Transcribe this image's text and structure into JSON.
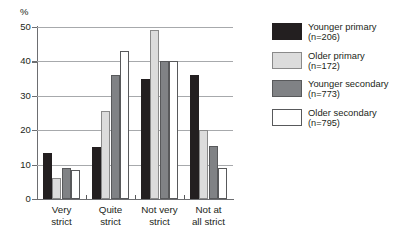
{
  "chart_data": {
    "type": "bar",
    "title": "",
    "xlabel": "",
    "ylabel": "%",
    "ylim": [
      0,
      50
    ],
    "yticks": [
      0,
      10,
      20,
      30,
      40,
      50
    ],
    "grid": true,
    "legend_position": "right",
    "categories": [
      "Very strict",
      "Quite strict",
      "Not very strict",
      "Not at all strict"
    ],
    "category_lines": [
      [
        "Very",
        "strict"
      ],
      [
        "Quite",
        "strict"
      ],
      [
        "Not very",
        "strict"
      ],
      [
        "Not at",
        "all strict"
      ]
    ],
    "series": [
      {
        "name": "Younger primary",
        "n": "(n=206)",
        "n_value": 206,
        "color": "#231f20",
        "values": [
          13.5,
          15.0,
          35.0,
          36.0
        ]
      },
      {
        "name": "Older primary",
        "n": "(n=172)",
        "n_value": 172,
        "color": "#dcdcdc",
        "values": [
          6.0,
          25.5,
          49.0,
          20.0
        ]
      },
      {
        "name": "Younger secondary",
        "n": "(n=773)",
        "n_value": 773,
        "color": "#808285",
        "values": [
          9.0,
          36.0,
          40.0,
          15.5
        ]
      },
      {
        "name": "Older secondary",
        "n": "(n=795)",
        "n_value": 795,
        "color": "#ffffff",
        "values": [
          8.5,
          43.0,
          40.0,
          9.0
        ]
      }
    ]
  },
  "axis": {
    "unit_label": "%",
    "tick_labels": [
      "0",
      "10",
      "20",
      "30",
      "40",
      "50"
    ]
  },
  "legend": {
    "items": [
      {
        "label": "Younger primary",
        "count": "(n=206)"
      },
      {
        "label": "Older primary",
        "count": "(n=172)"
      },
      {
        "label": "Younger secondary",
        "count": "(n=773)"
      },
      {
        "label": "Older secondary",
        "count": "(n=795)"
      }
    ]
  }
}
